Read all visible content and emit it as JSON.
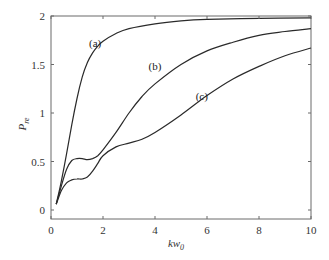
{
  "chart_data": {
    "type": "line",
    "title": "",
    "xlabel": "kw0",
    "xlabel_main": "kw",
    "xlabel_sub": "0",
    "ylabel": "Pre",
    "ylabel_main": "P",
    "ylabel_sub": "re",
    "xlim": [
      0,
      10
    ],
    "ylim": [
      -0.06,
      2
    ],
    "xticks": [
      0,
      2,
      4,
      6,
      8,
      10
    ],
    "xtick_labels": [
      "0",
      "2",
      "4",
      "6",
      "8",
      "10"
    ],
    "yticks": [
      0,
      0.5,
      1,
      1.5,
      2
    ],
    "ytick_labels": [
      "0",
      "0.5",
      "1",
      "1.5",
      "2"
    ],
    "grid": false,
    "legend": "inline labels",
    "series": [
      {
        "name": "(a)",
        "label_pos": [
          1.7,
          1.68
        ],
        "x": [
          0.2,
          0.4,
          0.6,
          0.8,
          1.0,
          1.2,
          1.4,
          1.6,
          1.8,
          2.0,
          2.5,
          3.0,
          4.0,
          5.0,
          6.0,
          8.0,
          10.0
        ],
        "y": [
          0.06,
          0.3,
          0.58,
          0.88,
          1.15,
          1.37,
          1.52,
          1.62,
          1.69,
          1.74,
          1.82,
          1.87,
          1.92,
          1.95,
          1.965,
          1.975,
          1.98
        ]
      },
      {
        "name": "(b)",
        "label_pos": [
          4.0,
          1.44
        ],
        "x": [
          0.2,
          0.4,
          0.6,
          0.8,
          1.0,
          1.2,
          1.4,
          1.6,
          1.8,
          2.0,
          2.5,
          3.0,
          3.5,
          4.0,
          5.0,
          6.0,
          7.0,
          8.0,
          9.0,
          10.0
        ],
        "y": [
          0.06,
          0.25,
          0.42,
          0.51,
          0.53,
          0.53,
          0.52,
          0.53,
          0.56,
          0.62,
          0.8,
          1.0,
          1.17,
          1.3,
          1.5,
          1.64,
          1.73,
          1.8,
          1.84,
          1.87
        ]
      },
      {
        "name": "(c)",
        "label_pos": [
          5.8,
          1.13
        ],
        "x": [
          0.2,
          0.4,
          0.6,
          0.8,
          1.0,
          1.2,
          1.4,
          1.6,
          1.8,
          2.0,
          2.5,
          3.0,
          3.5,
          4.0,
          5.0,
          6.0,
          7.0,
          8.0,
          9.0,
          10.0
        ],
        "y": [
          0.06,
          0.2,
          0.28,
          0.31,
          0.32,
          0.32,
          0.34,
          0.4,
          0.48,
          0.56,
          0.65,
          0.69,
          0.73,
          0.8,
          0.98,
          1.18,
          1.35,
          1.48,
          1.59,
          1.67
        ]
      }
    ]
  }
}
